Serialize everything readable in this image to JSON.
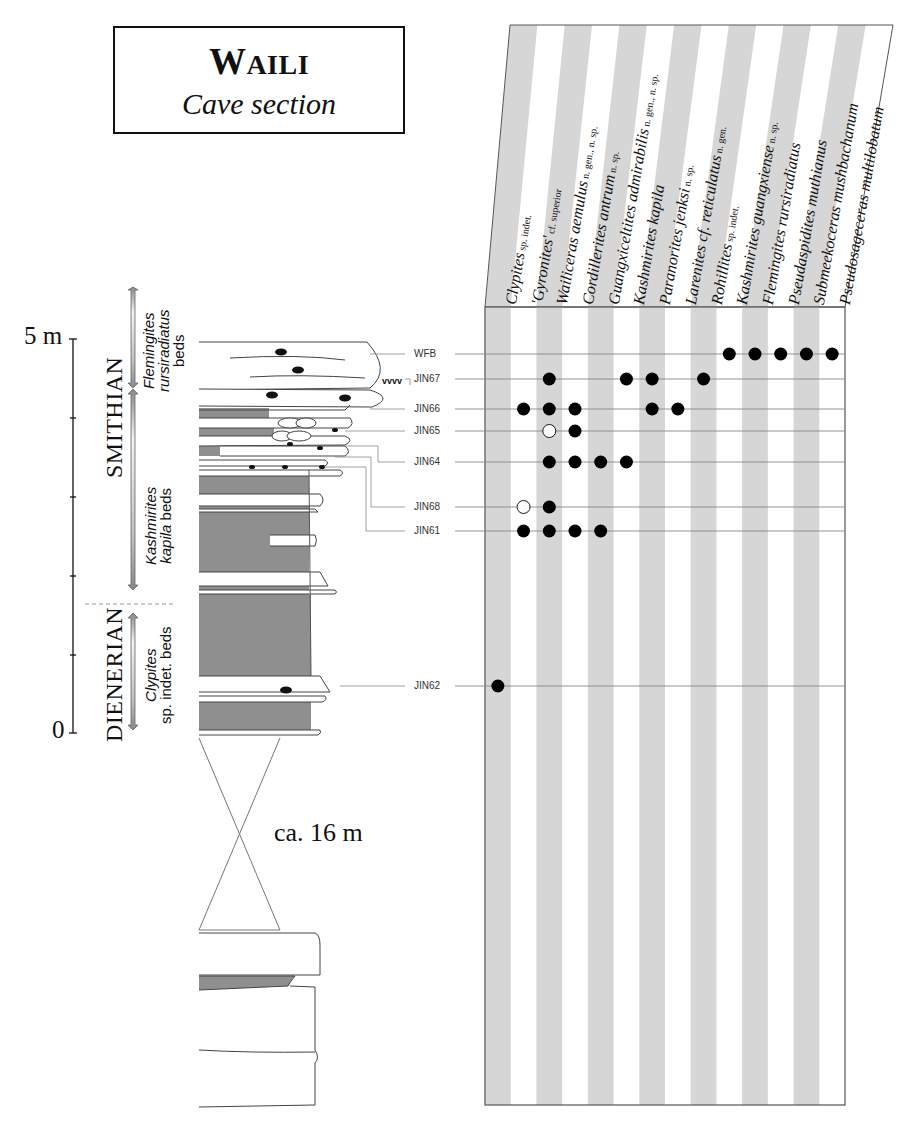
{
  "title": {
    "main_first": "W",
    "main_rest": "AILI",
    "subtitle": "Cave section"
  },
  "scale": {
    "top_label": "5 m",
    "bottom_label": "0",
    "ticks_m": [
      0,
      1,
      2,
      3,
      4,
      5
    ]
  },
  "stages": [
    {
      "name": "SMITHIAN"
    },
    {
      "name": "DIENERIAN"
    }
  ],
  "zones": [
    {
      "genus": "Flemingites",
      "species": "rursiradiatus",
      "suffix": "beds"
    },
    {
      "genus": "Kashmirites",
      "species": "kapila",
      "suffix": "beds"
    },
    {
      "genus": "Clypites",
      "species": "sp. indet.",
      "suffix": "beds"
    }
  ],
  "gap_label": "ca. 16 m",
  "unconformity_symbol": "vvvv",
  "chart_data": {
    "type": "table",
    "columns": [
      {
        "taxon": "Clypites",
        "qualifier": "sp. indet."
      },
      {
        "taxon": "'Gyronites'",
        "qualifier": "cf. superior"
      },
      {
        "taxon": "Wailiceras aemulus",
        "qualifier": "n. gen., n. sp."
      },
      {
        "taxon": "Cordillerites antrum",
        "qualifier": "n. sp."
      },
      {
        "taxon": "Guangxiceltites admirabilis",
        "qualifier": "n. gen., n. sp."
      },
      {
        "taxon": "Kashmirites kapila",
        "qualifier": ""
      },
      {
        "taxon": "Paranorites jenksi",
        "qualifier": "n. sp."
      },
      {
        "taxon": "Larenites cf. reticulatus",
        "qualifier": "n. gen."
      },
      {
        "taxon": "Rohillites",
        "qualifier": "sp. indet."
      },
      {
        "taxon": "Kashmirites guangxiense",
        "qualifier": "n. sp."
      },
      {
        "taxon": "Flemingites rursiradiatus",
        "qualifier": ""
      },
      {
        "taxon": "Pseudaspidites muthianus",
        "qualifier": ""
      },
      {
        "taxon": "Submeekoceras mushbachanum",
        "qualifier": ""
      },
      {
        "taxon": "Pseudosageceras multilobatum",
        "qualifier": ""
      }
    ],
    "rows": [
      {
        "sample": "WFB",
        "occurrences": [
          9,
          10,
          11,
          12,
          13
        ],
        "uncertain": []
      },
      {
        "sample": "JIN67",
        "occurrences": [
          2,
          5,
          6,
          8
        ],
        "uncertain": []
      },
      {
        "sample": "JIN66",
        "occurrences": [
          1,
          2,
          3,
          6,
          7
        ],
        "uncertain": []
      },
      {
        "sample": "JIN65",
        "occurrences": [
          3
        ],
        "uncertain": [
          2
        ]
      },
      {
        "sample": "JIN64",
        "occurrences": [
          2,
          3,
          4,
          5
        ],
        "uncertain": []
      },
      {
        "sample": "JIN68",
        "occurrences": [
          2
        ],
        "uncertain": [
          1
        ]
      },
      {
        "sample": "JIN61",
        "occurrences": [
          1,
          2,
          3,
          4
        ],
        "uncertain": []
      },
      {
        "sample": "JIN62",
        "occurrences": [
          0
        ],
        "uncertain": []
      }
    ],
    "legend": {
      "filled_circle": "present",
      "open_circle": "uncertain/cf. occurrence"
    }
  },
  "colors": {
    "stripe": "#d6d6d6",
    "shale": "#8f8f8f",
    "line": "#777777",
    "ink": "#111111"
  }
}
